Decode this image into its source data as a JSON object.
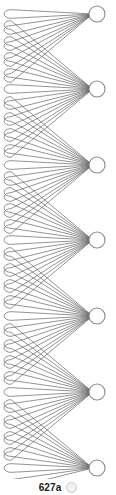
{
  "figure": {
    "caption": "627a",
    "badge_icon": "circle-badge-icon",
    "width": 116,
    "height": 495,
    "background_color": "#ffffff"
  },
  "style": {
    "edge_color": "#5a5a5a",
    "edge_width": 0.65,
    "node_fill": "#ffffff",
    "node_stroke": "#8a8a8a",
    "node_stroke_width": 1.1
  },
  "chart_data": {
    "type": "diagram",
    "diagram_kind": "multigraph-with-loops",
    "title": "627a",
    "node_radius": 8,
    "node_x": 97,
    "nodes": [
      {
        "id": "n1",
        "label": "",
        "x": 97,
        "y": 14
      },
      {
        "id": "n2",
        "label": "",
        "x": 97,
        "y": 89
      },
      {
        "id": "n3",
        "label": "",
        "x": 97,
        "y": 165
      },
      {
        "id": "n4",
        "label": "",
        "x": 97,
        "y": 240
      },
      {
        "id": "n5",
        "label": "",
        "x": 97,
        "y": 316
      },
      {
        "id": "n6",
        "label": "",
        "x": 97,
        "y": 392
      },
      {
        "id": "n7",
        "label": "",
        "x": 97,
        "y": 468
      }
    ],
    "loop_left_x": 4,
    "loop_tip_radius": 7,
    "loops_per_node_above": 4,
    "loops_per_node_below": 4,
    "loop_pitch": 16,
    "total_loops": 30,
    "crossing_points": [
      {
        "x": 22,
        "y": 52
      },
      {
        "x": 22,
        "y": 127
      },
      {
        "x": 22,
        "y": 203
      },
      {
        "x": 22,
        "y": 278
      },
      {
        "x": 22,
        "y": 354
      },
      {
        "x": 22,
        "y": 430
      }
    ]
  }
}
